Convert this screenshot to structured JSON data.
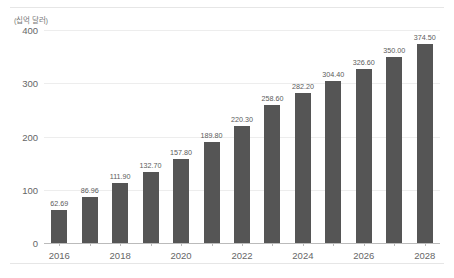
{
  "chart_data": {
    "type": "bar",
    "title": "",
    "subtitle": "",
    "xlabel": "",
    "ylabel": "(십억 달러)",
    "ylim": [
      0,
      400
    ],
    "yticks": [
      0,
      100,
      200,
      300,
      400
    ],
    "ytick_labels": [
      "0",
      "100",
      "200",
      "300",
      "400"
    ],
    "grid": true,
    "legend": false,
    "bar_color": "#555555",
    "categories": [
      "2016",
      "2017",
      "2018",
      "2019",
      "2020",
      "2021",
      "2022",
      "2023",
      "2024",
      "2025",
      "2026",
      "2027",
      "2028"
    ],
    "xtick_labels": [
      "2016",
      "",
      "2018",
      "",
      "2020",
      "",
      "2022",
      "",
      "2024",
      "",
      "2026",
      "",
      "2028"
    ],
    "values": [
      62.69,
      86.96,
      111.9,
      132.7,
      157.8,
      189.8,
      220.3,
      258.6,
      282.2,
      304.4,
      326.6,
      350.0,
      374.5
    ],
    "value_labels": [
      "62.69",
      "86.96",
      "111.90",
      "132.70",
      "157.80",
      "189.80",
      "220.30",
      "258.60",
      "282.20",
      "304.40",
      "326.60",
      "350.00",
      "374.50"
    ]
  }
}
